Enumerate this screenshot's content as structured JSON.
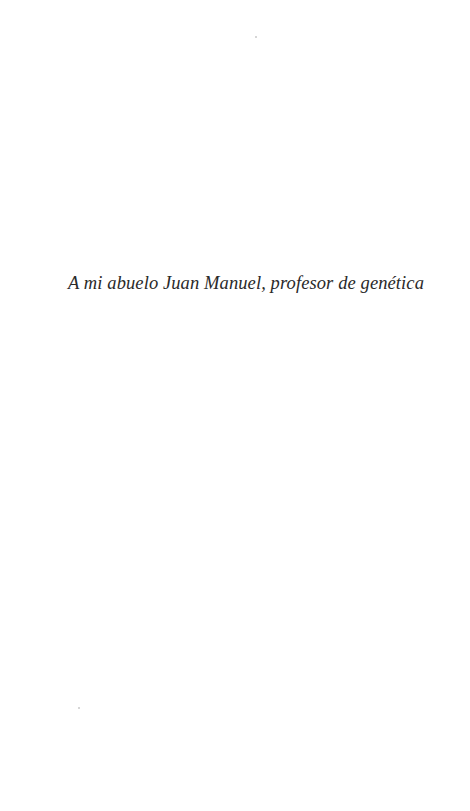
{
  "page": {
    "background": "#ffffff",
    "text_color": "#2a2a2a"
  },
  "dedication": {
    "text": "A mi abuelo Juan Manuel, profesor de genética"
  }
}
